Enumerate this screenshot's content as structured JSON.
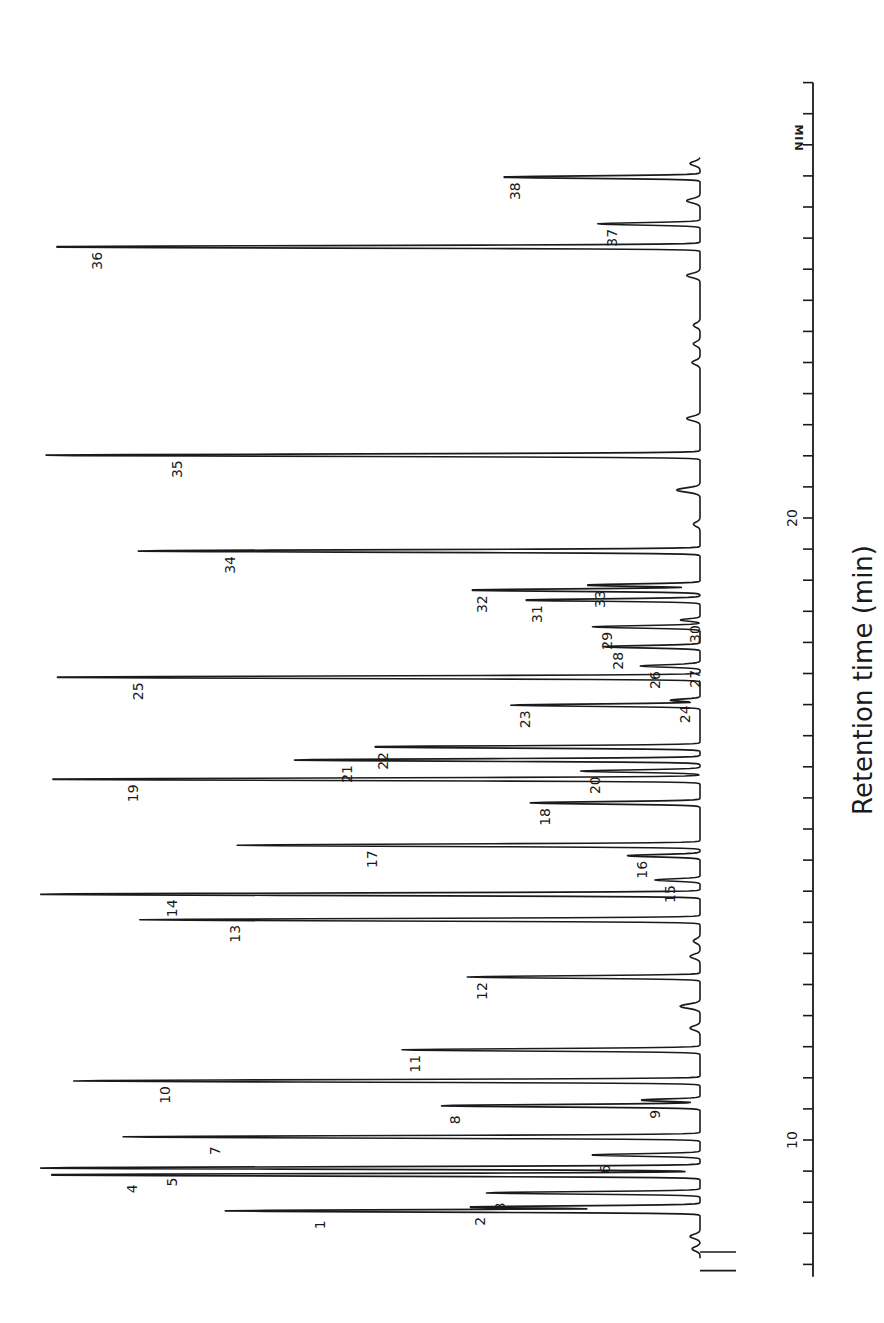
{
  "chart_data": {
    "type": "line",
    "subtype": "chromatogram",
    "orientation": "rotated-90 (time axis vertical on right, signal extends leftward)",
    "title": "",
    "xlabel": "Retention time (min)",
    "ylabel": "",
    "axis_unit_label": "MIN",
    "xlim": [
      7.8,
      27.0
    ],
    "major_ticks": [
      10,
      20
    ],
    "minor_tick_interval": 0.5,
    "grid": false,
    "legend": null,
    "peaks": [
      {
        "id": "1",
        "t": 8.86,
        "height": 71.6
      },
      {
        "id": "2",
        "t": 8.92,
        "height": 35.4
      },
      {
        "id": "3",
        "t": 9.15,
        "height": 32.4
      },
      {
        "id": "4",
        "t": 9.44,
        "height": 100.0
      },
      {
        "id": "5",
        "t": 9.55,
        "height": 100.0
      },
      {
        "id": "6",
        "t": 9.76,
        "height": 16.6
      },
      {
        "id": "7",
        "t": 10.05,
        "height": 87.5
      },
      {
        "id": "8",
        "t": 10.55,
        "height": 39.2
      },
      {
        "id": "9",
        "t": 10.64,
        "height": 9.0
      },
      {
        "id": "10",
        "t": 10.95,
        "height": 95.0
      },
      {
        "id": "11",
        "t": 11.45,
        "height": 45.2
      },
      {
        "id": "12",
        "t": 12.62,
        "height": 35.1
      },
      {
        "id": "13",
        "t": 13.54,
        "height": 84.5
      },
      {
        "id": "14",
        "t": 13.95,
        "height": 100.0
      },
      {
        "id": "15",
        "t": 14.18,
        "height": 6.8
      },
      {
        "id": "16",
        "t": 14.57,
        "height": 11.0
      },
      {
        "id": "17",
        "t": 14.74,
        "height": 69.8
      },
      {
        "id": "18",
        "t": 15.42,
        "height": 25.6
      },
      {
        "id": "19",
        "t": 15.8,
        "height": 99.8
      },
      {
        "id": "20",
        "t": 15.93,
        "height": 18.1
      },
      {
        "id": "21",
        "t": 16.11,
        "height": 61.5
      },
      {
        "id": "22",
        "t": 16.32,
        "height": 50.1
      },
      {
        "id": "23",
        "t": 16.99,
        "height": 28.7
      },
      {
        "id": "24",
        "t": 17.07,
        "height": 4.5
      },
      {
        "id": "25",
        "t": 17.44,
        "height": 99.1
      },
      {
        "id": "26",
        "t": 17.62,
        "height": 9.0
      },
      {
        "id": "27",
        "t": 17.64,
        "height": 3.0
      },
      {
        "id": "28",
        "t": 17.93,
        "height": 14.6
      },
      {
        "id": "29",
        "t": 18.25,
        "height": 16.3
      },
      {
        "id": "30",
        "t": 18.36,
        "height": 3.0
      },
      {
        "id": "31",
        "t": 18.68,
        "height": 26.8
      },
      {
        "id": "32",
        "t": 18.84,
        "height": 35.1
      },
      {
        "id": "33",
        "t": 18.92,
        "height": 17.3
      },
      {
        "id": "34",
        "t": 19.47,
        "height": 85.2
      },
      {
        "id": "35",
        "t": 21.01,
        "height": 99.2
      },
      {
        "id": "36",
        "t": 24.36,
        "height": 99.2
      },
      {
        "id": "37",
        "t": 24.73,
        "height": 15.5
      },
      {
        "id": "38",
        "t": 25.48,
        "height": 30.2
      }
    ],
    "minor_peaks": [
      {
        "t": 8.45,
        "height": 1.5
      },
      {
        "t": 8.25,
        "height": 1.2
      },
      {
        "t": 12.15,
        "height": 3.0
      },
      {
        "t": 12.95,
        "height": 1.5
      },
      {
        "t": 13.2,
        "height": 1.0
      },
      {
        "t": 11.8,
        "height": 1.5
      },
      {
        "t": 20.45,
        "height": 3.5
      },
      {
        "t": 19.9,
        "height": 1.0
      },
      {
        "t": 21.6,
        "height": 2.0
      },
      {
        "t": 22.5,
        "height": 1.2
      },
      {
        "t": 22.8,
        "height": 1.0
      },
      {
        "t": 23.1,
        "height": 1.0
      },
      {
        "t": 23.9,
        "height": 2.0
      },
      {
        "t": 25.1,
        "height": 2.0
      },
      {
        "t": 25.7,
        "height": 1.5
      }
    ],
    "injection_marks": [
      7.9,
      8.2
    ]
  },
  "axis": {
    "unit_label": "MIN",
    "tick_labels": [
      {
        "value": 10,
        "label": "10"
      },
      {
        "value": 20,
        "label": "20"
      }
    ],
    "title": "Retention time (min)"
  }
}
